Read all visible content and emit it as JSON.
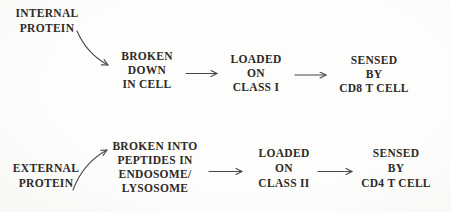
{
  "colors": {
    "background": "#fcfcfa",
    "text": "#2e2a27",
    "arrow": "#474747"
  },
  "diagram_title": "Antigen processing pathways flow diagram",
  "pathway_internal": {
    "source": {
      "lines": [
        "INTERNAL",
        "PROTEIN"
      ]
    },
    "steps": [
      {
        "lines": [
          "BROKEN",
          "DOWN",
          "IN CELL"
        ]
      },
      {
        "lines": [
          "LOADED",
          "ON",
          "CLASS I"
        ]
      },
      {
        "lines": [
          "SENSED",
          "BY",
          "CD8 T CELL"
        ]
      }
    ]
  },
  "pathway_external": {
    "source": {
      "lines": [
        "EXTERNAL",
        "PROTEIN"
      ]
    },
    "steps": [
      {
        "lines": [
          "BROKEN INTO",
          "PEPTIDES IN",
          "ENDOSOME/",
          "LYSOSOME"
        ]
      },
      {
        "lines": [
          "LOADED",
          "ON",
          "CLASS II"
        ]
      },
      {
        "lines": [
          "SENSED",
          "BY",
          "CD4 T CELL"
        ]
      }
    ]
  }
}
